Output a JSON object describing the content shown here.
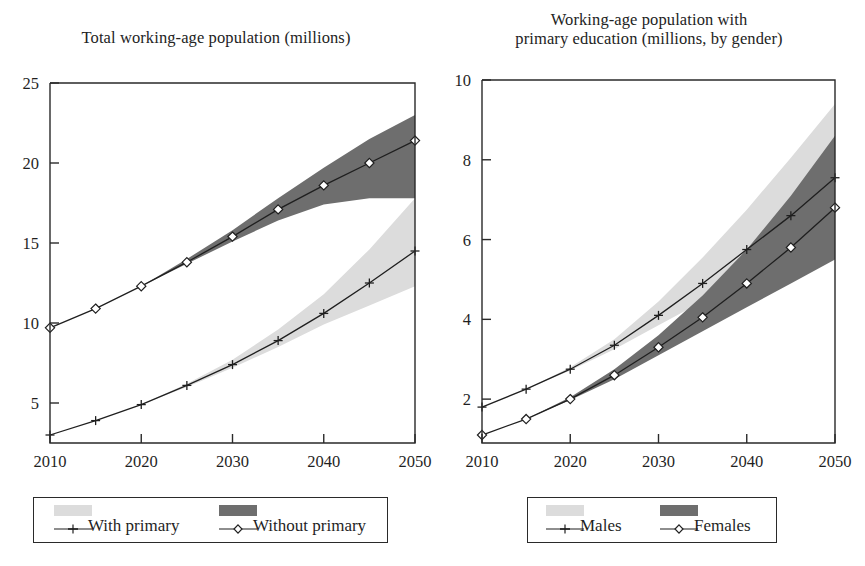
{
  "figure": {
    "background": "#ffffff",
    "ink_color": "#1f1f1f",
    "band_light_color": "#dcdcdc",
    "band_dark_color": "#6e6e6e"
  },
  "panels": [
    {
      "id": "total-working-age-population",
      "title": "Total working-age population (millions)",
      "legend": {
        "entries": [
          {
            "label": "With primary",
            "swatch": "#dcdcdc",
            "marker": "plus"
          },
          {
            "label": "Without primary",
            "swatch": "#6e6e6e",
            "marker": "diamond"
          }
        ]
      }
    },
    {
      "id": "working-age-population-primary-education",
      "title_line1": "Working-age population with",
      "title_line2": "primary education (millions, by gender)",
      "legend": {
        "entries": [
          {
            "label": "Males",
            "swatch": "#dcdcdc",
            "marker": "plus"
          },
          {
            "label": "Females",
            "swatch": "#6e6e6e",
            "marker": "diamond"
          }
        ]
      }
    }
  ],
  "chart_data": [
    {
      "type": "line",
      "title": "Total working-age population (millions)",
      "xlabel": "",
      "ylabel": "",
      "xlim": [
        2010,
        2050
      ],
      "ylim": [
        2.5,
        25
      ],
      "xticks": [
        2010,
        2020,
        2030,
        2040,
        2050
      ],
      "yticks": [
        5,
        10,
        15,
        20,
        25
      ],
      "grid": false,
      "legend_position": "below",
      "x": [
        2010,
        2015,
        2020,
        2025,
        2030,
        2035,
        2040,
        2045,
        2050
      ],
      "series": [
        {
          "name": "With primary",
          "marker": "plus",
          "band_color": "#dcdcdc",
          "values": [
            3.0,
            3.9,
            4.9,
            6.1,
            7.4,
            8.9,
            10.6,
            12.5,
            14.5
          ],
          "band_low": [
            3.0,
            3.9,
            4.9,
            6.0,
            7.2,
            8.5,
            9.9,
            11.1,
            12.3
          ],
          "band_high": [
            3.0,
            3.9,
            4.9,
            6.2,
            7.7,
            9.6,
            11.8,
            14.6,
            17.8
          ]
        },
        {
          "name": "Without primary",
          "marker": "diamond",
          "band_color": "#6e6e6e",
          "values": [
            9.7,
            10.9,
            12.3,
            13.8,
            15.4,
            17.1,
            18.6,
            20.0,
            21.4
          ],
          "band_low": [
            9.7,
            10.9,
            12.3,
            13.7,
            15.1,
            16.4,
            17.4,
            17.8,
            17.8
          ],
          "band_high": [
            9.7,
            10.9,
            12.3,
            14.0,
            15.8,
            17.8,
            19.7,
            21.5,
            23.0
          ]
        }
      ]
    },
    {
      "type": "line",
      "title": "Working-age population with primary education (millions, by gender)",
      "xlabel": "",
      "ylabel": "",
      "xlim": [
        2010,
        2050
      ],
      "ylim": [
        0.9,
        10
      ],
      "xticks": [
        2010,
        2020,
        2030,
        2040,
        2050
      ],
      "yticks": [
        2,
        4,
        6,
        8,
        10
      ],
      "grid": false,
      "legend_position": "below",
      "x": [
        2010,
        2015,
        2020,
        2025,
        2030,
        2035,
        2040,
        2045,
        2050
      ],
      "series": [
        {
          "name": "Males",
          "marker": "plus",
          "band_color": "#dcdcdc",
          "values": [
            1.8,
            2.25,
            2.75,
            3.35,
            4.1,
            4.9,
            5.75,
            6.6,
            7.55
          ],
          "band_low": [
            1.8,
            2.25,
            2.72,
            3.25,
            3.85,
            4.45,
            5.0,
            5.5,
            6.0
          ],
          "band_high": [
            1.8,
            2.25,
            2.8,
            3.5,
            4.45,
            5.55,
            6.75,
            8.05,
            9.4
          ]
        },
        {
          "name": "Females",
          "marker": "diamond",
          "band_color": "#6e6e6e",
          "values": [
            1.1,
            1.5,
            2.0,
            2.6,
            3.3,
            4.05,
            4.9,
            5.8,
            6.8
          ],
          "band_low": [
            1.1,
            1.5,
            1.98,
            2.5,
            3.1,
            3.7,
            4.3,
            4.9,
            5.5
          ],
          "band_high": [
            1.1,
            1.5,
            2.05,
            2.75,
            3.6,
            4.6,
            5.75,
            7.1,
            8.6
          ]
        }
      ]
    }
  ]
}
